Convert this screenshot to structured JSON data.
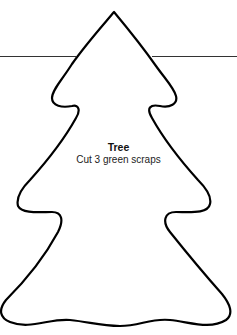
{
  "template": {
    "title": "Tree",
    "instruction": "Cut 3 green scraps"
  },
  "colors": {
    "outline": "#000000",
    "background": "#ffffff"
  }
}
